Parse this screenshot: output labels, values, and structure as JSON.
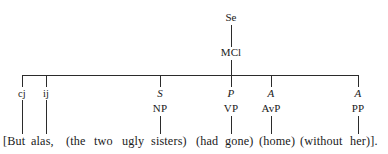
{
  "diagram": {
    "type": "syntactic-tree",
    "colors": {
      "background": "#ffffff",
      "line": "#2b2b2b",
      "text": "#1a1a1a"
    },
    "root": {
      "label": "Se",
      "x": 231,
      "y": 12
    },
    "clause": {
      "label": "MCl",
      "x": 231,
      "y": 47
    },
    "bar": {
      "left": 22,
      "right": 358,
      "y": 75
    },
    "branches": [
      {
        "function": "cj",
        "function_italic": false,
        "form": "",
        "x": 22,
        "text": "But"
      },
      {
        "function": "ij",
        "function_italic": false,
        "form": "",
        "x": 46,
        "text": "alas,"
      },
      {
        "function": "S",
        "function_italic": true,
        "form": "NP",
        "x": 160,
        "text": "(the two ugly sisters)"
      },
      {
        "function": "P",
        "function_italic": true,
        "form": "VP",
        "x": 231,
        "text": "(had gone)"
      },
      {
        "function": "A",
        "function_italic": true,
        "form": "AvP",
        "x": 271,
        "text": "(home)"
      },
      {
        "function": "A",
        "function_italic": true,
        "form": "PP",
        "x": 358,
        "text": "(without her)"
      }
    ],
    "sentence": {
      "full_text": "[But alas, (the two ugly sisters) (had gone) (home) (without her)].",
      "segments": [
        {
          "text": "[But",
          "x": 3
        },
        {
          "text": "alas,",
          "x": 31
        },
        {
          "text": "(the",
          "x": 66
        },
        {
          "text": "two",
          "x": 94
        },
        {
          "text": "ugly",
          "x": 122
        },
        {
          "text": "sisters)",
          "x": 151
        },
        {
          "text": "(had",
          "x": 196
        },
        {
          "text": "gone)",
          "x": 225
        },
        {
          "text": "(home)",
          "x": 259
        },
        {
          "text": "(without",
          "x": 300
        },
        {
          "text": "her)].",
          "x": 350
        }
      ]
    }
  }
}
